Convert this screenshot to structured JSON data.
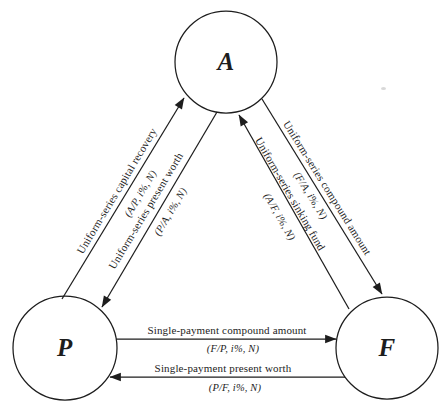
{
  "diagram": {
    "background": "#ffffff",
    "ink": "#1d1d1d",
    "nodes": {
      "A": {
        "label": "A"
      },
      "P": {
        "label": "P"
      },
      "F": {
        "label": "F"
      }
    },
    "edges": {
      "capital_recovery": {
        "label": "Uniform-series capital recovery",
        "formula": "(A/P, i%, N)",
        "from": "P",
        "to": "A"
      },
      "present_worth": {
        "label": "Uniform-series present worth",
        "formula": "(P/A, i%, N)",
        "from": "A",
        "to": "P"
      },
      "sinking_fund": {
        "label": "Uniform-series sinking fund",
        "formula": "(A/F, i%, N)",
        "from": "F",
        "to": "A"
      },
      "compound_amount": {
        "label": "Uniform-series compound amount",
        "formula": "(F/A, i%, N)",
        "from": "A",
        "to": "F"
      },
      "single_payment_compound_amount": {
        "label": "Single-payment compound amount",
        "formula": "(F/P, i%, N)",
        "from": "P",
        "to": "F"
      },
      "single_payment_present_worth": {
        "label": "Single-payment present worth",
        "formula": "(P/F, i%, N)",
        "from": "F",
        "to": "P"
      }
    }
  }
}
